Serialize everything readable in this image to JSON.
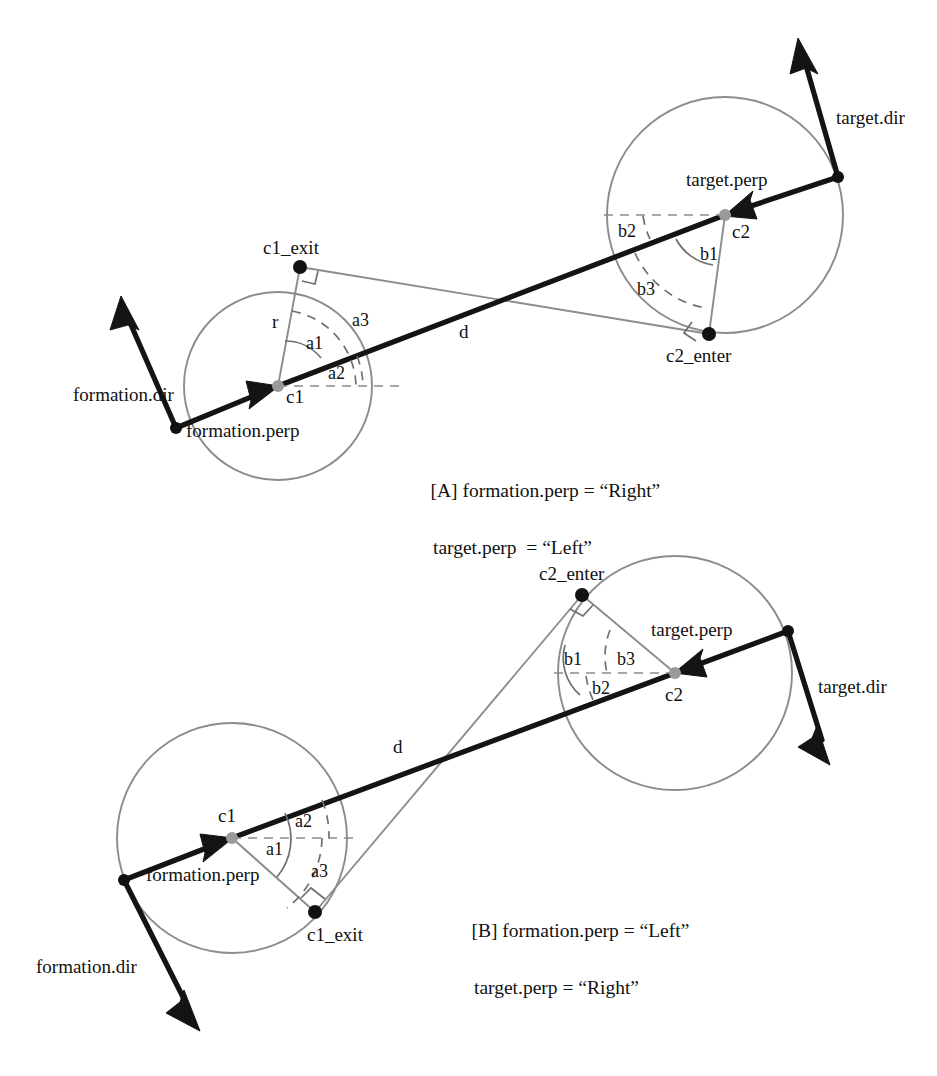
{
  "figure": {
    "type": "geometric-diagram",
    "background_color": "#ffffff",
    "line_colors": {
      "circle": "#8c8c8c",
      "thin_tangent": "#8c8c8c",
      "thick_vector": "#141414",
      "dashed_guide": "#8c8c8c",
      "point_black": "#111111",
      "point_gray": "#9a9a9a"
    }
  },
  "panels": [
    {
      "id": "A",
      "caption_line1": "[A] formation.perp = “Right”",
      "caption_line2": "target.perp  = “Left”",
      "labels": {
        "formation_dir": "formation.dir",
        "formation_perp": "formation.perp",
        "target_dir": "target.dir",
        "target_perp": "target.perp",
        "c1": "c1",
        "c2": "c2",
        "c1_exit": "c1_exit",
        "c2_enter": "c2_enter",
        "radius": "r",
        "distance": "d",
        "a1": "a1",
        "a2": "a2",
        "a3": "a3",
        "b1": "b1",
        "b2": "b2",
        "b3": "b3"
      },
      "geometry": {
        "c1_center": [
          278,
          386
        ],
        "c1_radius": 94,
        "c2_center": [
          725,
          215
        ],
        "c2_radius": 118,
        "c1_exit": [
          300,
          267
        ],
        "c2_enter": [
          709,
          334
        ]
      }
    },
    {
      "id": "B",
      "caption_line1": "[B] formation.perp = “Left”",
      "caption_line2": "target.perp = “Right”",
      "labels": {
        "formation_dir": "formation.dir",
        "formation_perp": "formation.perp",
        "target_dir": "target.dir",
        "target_perp": "target.perp",
        "c1": "c1",
        "c2": "c2",
        "c1_exit": "c1_exit",
        "c2_enter": "c2_enter",
        "distance": "d",
        "a1": "a1",
        "a2": "a2",
        "a3": "a3",
        "b1": "b1",
        "b2": "b2",
        "b3": "b3"
      },
      "geometry": {
        "c1_center": [
          232,
          838
        ],
        "c1_radius": 115,
        "c2_center": [
          675,
          673
        ],
        "c2_radius": 117,
        "c1_exit": [
          315,
          912
        ],
        "c2_enter": [
          582,
          595
        ]
      }
    }
  ]
}
